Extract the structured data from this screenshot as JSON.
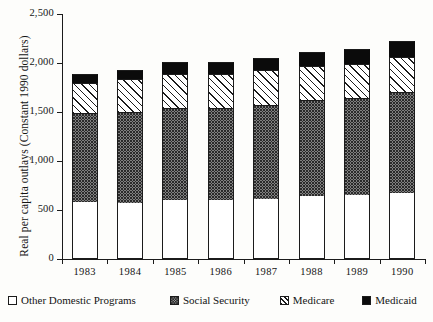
{
  "chart_data": {
    "type": "bar",
    "subtype": "stacked-column",
    "title": "",
    "xlabel": "",
    "ylabel": "Real per capita outlays (Constant 1990 dollars)",
    "categories": [
      "1983",
      "1984",
      "1985",
      "1986",
      "1987",
      "1988",
      "1989",
      "1990"
    ],
    "ylim": [
      0,
      2500
    ],
    "yticks": [
      0,
      500,
      1000,
      1500,
      2000,
      2500
    ],
    "ytick_labels": [
      "0",
      "500",
      "1,000",
      "1,500",
      "2,000",
      "2,500"
    ],
    "grid": false,
    "legend_position": "bottom",
    "series": [
      {
        "name": "Other Domestic Programs",
        "pattern": "open-white",
        "color": "#ffffff",
        "values": [
          582,
          571,
          602,
          602,
          612,
          643,
          653,
          673
        ]
      },
      {
        "name": "Social Security",
        "pattern": "stipple-dots",
        "color": "#d6d6d6",
        "values": [
          908,
          929,
          939,
          939,
          959,
          979,
          990,
          1031
        ]
      },
      {
        "name": "Medicare",
        "pattern": "diagonal-hatch",
        "color": "#ffffff",
        "values": [
          306,
          337,
          347,
          347,
          358,
          347,
          347,
          357
        ]
      },
      {
        "name": "Medicaid",
        "pattern": "solid-black",
        "color": "#0b0b0b",
        "values": [
          92,
          92,
          122,
          122,
          122,
          143,
          153,
          163
        ]
      }
    ],
    "totals": [
      1888,
      1929,
      2010,
      2010,
      2051,
      2112,
      2143,
      2224
    ],
    "cumulative_tops": {
      "other": [
        582,
        571,
        602,
        602,
        612,
        643,
        653,
        673
      ],
      "social_security": [
        1490,
        1500,
        1541,
        1541,
        1571,
        1622,
        1643,
        1704
      ],
      "medicare": [
        1796,
        1837,
        1888,
        1888,
        1929,
        1969,
        1990,
        2061
      ],
      "medicaid": [
        1888,
        1929,
        2010,
        2010,
        2051,
        2112,
        2143,
        2224
      ]
    }
  },
  "legend": {
    "items": [
      {
        "label": "Other Domestic Programs",
        "swatch": "open-white"
      },
      {
        "label": "Social Security",
        "swatch": "stipple-dots"
      },
      {
        "label": "Medicare",
        "swatch": "diagonal-hatch"
      },
      {
        "label": "Medicaid",
        "swatch": "solid-black"
      }
    ]
  }
}
